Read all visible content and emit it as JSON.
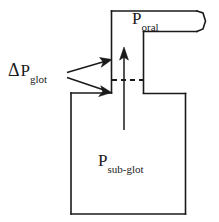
{
  "figure": {
    "background_color": "#ffffff",
    "stroke_color": "#1a1a1a",
    "text_color": "#1a1a1a",
    "width": 219,
    "height": 222
  },
  "labels": {
    "delta_p_glot": {
      "delta_symbol": "Δ",
      "base": "P",
      "subscript": "glot",
      "full_text": "Δ P glot"
    },
    "p_oral": {
      "base": "P",
      "subscript": "oral",
      "full_text": "P oral"
    },
    "p_sub_glot": {
      "base": "P",
      "subscript": "sub-glot",
      "full_text": "P sub-glot"
    }
  },
  "annotations": {
    "flow_arrow": {
      "name": "upward-flow-arrow",
      "direction": "up",
      "from_y": 130,
      "to_y": 48,
      "x": 124
    },
    "glottis_line": {
      "name": "glottis-dashed-line",
      "style": "dashed",
      "x_start": 112,
      "x_end": 144,
      "y": 80
    },
    "pointer_upper": {
      "name": "pointer-arrow-upper",
      "from": [
        66,
        73
      ],
      "to": [
        112,
        62
      ]
    },
    "pointer_lower": {
      "name": "pointer-arrow-lower",
      "from": [
        66,
        77
      ],
      "to": [
        112,
        92
      ]
    }
  },
  "shapes": {
    "oral_cavity": {
      "name": "oral-cavity-outline",
      "description": "upper chamber with lip opening on right"
    },
    "subglottal_cavity": {
      "name": "subglottal-cavity-outline",
      "description": "lower rectangular chamber"
    }
  }
}
